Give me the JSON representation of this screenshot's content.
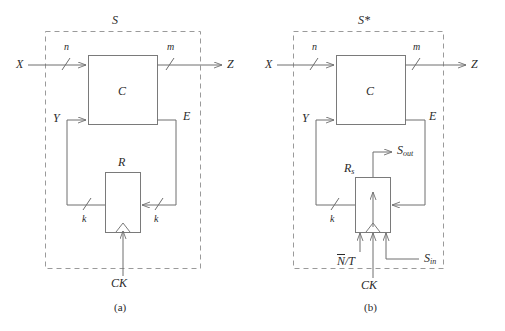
{
  "figure": {
    "type": "block-diagram",
    "title": "",
    "panels": [
      {
        "caption": "(a)",
        "system_label": "S",
        "blocks": [
          {
            "name": "C",
            "label": "C",
            "role": "combinational-logic"
          },
          {
            "name": "R",
            "label": "R",
            "role": "register"
          }
        ],
        "signals": [
          {
            "name": "X",
            "label": "X",
            "role": "primary-input"
          },
          {
            "name": "Z",
            "label": "Z",
            "role": "primary-output"
          },
          {
            "name": "Y",
            "label": "Y",
            "role": "state-feedback-input"
          },
          {
            "name": "E",
            "label": "E",
            "role": "excitation-output"
          },
          {
            "name": "CK",
            "label": "CK",
            "role": "clock-input"
          }
        ],
        "bus_widths": [
          {
            "name": "n",
            "label": "n",
            "on": "X-to-C"
          },
          {
            "name": "m",
            "label": "m",
            "on": "C-to-Z"
          },
          {
            "name": "k-left",
            "label": "k",
            "on": "R-to-Y"
          },
          {
            "name": "k-right",
            "label": "k",
            "on": "E-to-R"
          }
        ]
      },
      {
        "caption": "(b)",
        "system_label": "S*",
        "blocks": [
          {
            "name": "C",
            "label": "C",
            "role": "combinational-logic"
          },
          {
            "name": "R_s",
            "label": "R",
            "sub": "s",
            "role": "scan-register"
          }
        ],
        "signals": [
          {
            "name": "X",
            "label": "X",
            "role": "primary-input"
          },
          {
            "name": "Z",
            "label": "Z",
            "role": "primary-output"
          },
          {
            "name": "Y",
            "label": "Y",
            "role": "state-feedback-input"
          },
          {
            "name": "E",
            "label": "E",
            "role": "excitation-output"
          },
          {
            "name": "CK",
            "label": "CK",
            "role": "clock-input"
          },
          {
            "name": "S_in",
            "label": "S",
            "sub": "in",
            "role": "scan-in"
          },
          {
            "name": "S_out",
            "label": "S",
            "sub": "out",
            "role": "scan-out"
          },
          {
            "name": "NT",
            "label": "N/T",
            "overbar": "N",
            "rest": "/T",
            "role": "normal-test-mode-select"
          }
        ],
        "bus_widths": [
          {
            "name": "n",
            "label": "n",
            "on": "X-to-C"
          },
          {
            "name": "m",
            "label": "m",
            "on": "C-to-Z"
          },
          {
            "name": "k-left",
            "label": "k",
            "on": "R_s-to-Y"
          }
        ]
      }
    ],
    "colors": {
      "line": "#6e6e6e",
      "boundary_dash": "#9a9a9a",
      "box_stroke": "#7a7a7a",
      "text": "#2a2a2a",
      "background": "#ffffff"
    }
  }
}
